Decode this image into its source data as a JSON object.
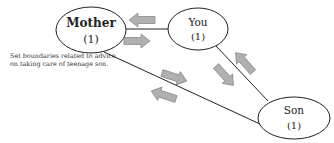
{
  "diagram": {
    "nodes": [
      {
        "id": "mother",
        "name": "Mother",
        "count": "(1)"
      },
      {
        "id": "you",
        "name": "You",
        "count": "(1)"
      },
      {
        "id": "son",
        "name": "Son",
        "count": "(1)"
      }
    ],
    "edges": [
      {
        "from": "mother",
        "to": "you"
      },
      {
        "from": "mother",
        "to": "son"
      },
      {
        "from": "you",
        "to": "son"
      }
    ],
    "arrows": [
      {
        "between": "mother-you",
        "direction": "toward-mother"
      },
      {
        "between": "mother-you",
        "direction": "toward-you"
      },
      {
        "between": "mother-son",
        "direction": "toward-son"
      },
      {
        "between": "mother-son",
        "direction": "toward-mother"
      },
      {
        "between": "you-son",
        "direction": "toward-son"
      },
      {
        "between": "you-son",
        "direction": "toward-you"
      }
    ],
    "note": "Set boundaries related to advice on taking care of teenage son.",
    "colors": {
      "arrow_fill": "#b0b0b0",
      "arrow_stroke": "#8a8a8a",
      "line": "#222222"
    }
  }
}
